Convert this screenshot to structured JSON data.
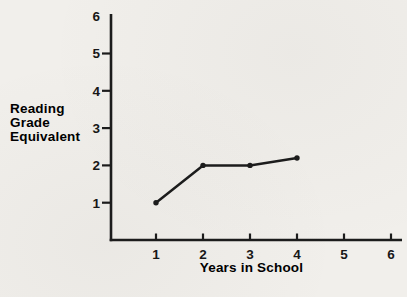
{
  "chart_data": {
    "type": "line",
    "title": "",
    "xlabel": "Years in School",
    "ylabel": "Reading Grade Equivalent",
    "ylabel_lines": [
      "Reading",
      "Grade",
      "Equivalent"
    ],
    "x": [
      1,
      2,
      3,
      4
    ],
    "y": [
      1,
      2,
      2,
      2.2
    ],
    "x_ticks": [
      "1",
      "2",
      "3",
      "4",
      "5",
      "6"
    ],
    "y_ticks": [
      "1",
      "2",
      "3",
      "4",
      "5",
      "6"
    ],
    "xlim": [
      0,
      6.2
    ],
    "ylim": [
      0,
      6.05
    ],
    "grid": false,
    "legend": "none",
    "marker": "dot",
    "colors": {
      "ink": "#1c1c1c",
      "text": "#171717",
      "paper": "#f1efeb"
    }
  }
}
